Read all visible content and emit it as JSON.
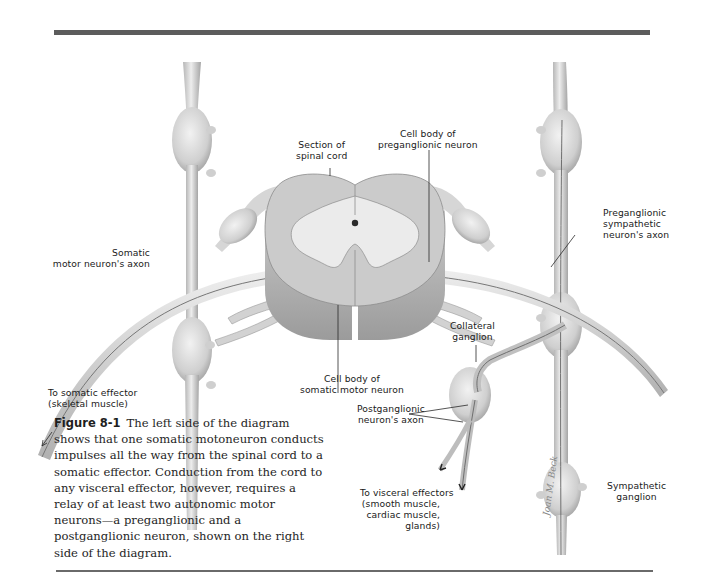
{
  "figure": {
    "number": "Figure 8-1",
    "caption": "The left side of the diagram shows that one somatic motoneuron conducts impulses all the way from the spinal cord to a somatic effector. Conduction from the cord to any visceral effector, however, requires a relay of at least two autonomic motor neurons—a preganglionic and a postganglionic neuron, shown on the right side of the diagram."
  },
  "labels": {
    "section_spinal_cord": [
      "Section of",
      "spinal cord"
    ],
    "cell_body_preganglionic": [
      "Cell body of",
      "preganglionic neuron"
    ],
    "somatic_axon": [
      "Somatic",
      "motor neuron's axon"
    ],
    "preganglionic_axon": [
      "Preganglionic",
      "sympathetic",
      "neuron's axon"
    ],
    "collateral_ganglion": [
      "Collateral",
      "ganglion"
    ],
    "cell_body_somatic": [
      "Cell body of",
      "somatic motor neuron"
    ],
    "to_somatic_effector": [
      "To somatic effector",
      "(skeletal muscle)"
    ],
    "postganglionic_axon": [
      "Postganglionic",
      "neuron's axon"
    ],
    "to_visceral_effectors": [
      "To visceral effectors",
      "(smooth muscle,",
      "cardiac muscle,",
      "glands)"
    ],
    "sympathetic_ganglion": [
      "Sympathetic",
      "ganglion"
    ]
  },
  "signature": "Joan M. Beck",
  "colors": {
    "tissue_fill": "#d8d8d8",
    "tissue_shadow": "#a9a9a9",
    "gray_matter": "#e9e9e9",
    "rule": "#5c5c5c",
    "text": "#1a1a1a"
  }
}
